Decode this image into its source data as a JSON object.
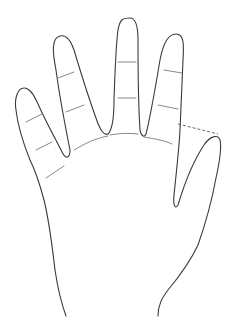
{
  "figure": {
    "colors": {
      "background": "#ffffff",
      "outline": "#3a3a3a",
      "crease": "#7a7a7a"
    }
  }
}
